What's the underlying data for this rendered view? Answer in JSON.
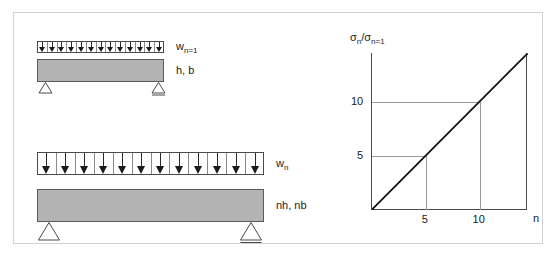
{
  "figure": {
    "background_color": "#ffffff",
    "frame_color": "#d2d2d2",
    "beam_fill_color": "#b3b3b3",
    "line_color": "#1a1a1a",
    "grid_color": "#9a9a9a"
  },
  "beams": [
    {
      "id": "beam-unit",
      "load_label": "w",
      "load_label_sub": "n=1",
      "section_label": "h, b",
      "arrow_count": 13,
      "arrow_size": "small",
      "support_left": "pin",
      "support_right": "roller"
    },
    {
      "id": "beam-scaled",
      "load_label": "w",
      "load_label_sub": "n",
      "section_label": "nh, nb",
      "arrow_count": 12,
      "arrow_size": "large",
      "support_left": "pin",
      "support_right": "roller"
    }
  ],
  "chart_data": {
    "type": "line",
    "title": "",
    "xlabel": "n",
    "ylabel_main": "σ",
    "ylabel_sub1": "n",
    "ylabel_mid": "/σ",
    "ylabel_sub2": "n=1",
    "ylabel_full": "σn/σn=1",
    "x": [
      0,
      5,
      10,
      14.5
    ],
    "y": [
      0,
      5,
      10,
      14.5
    ],
    "series": [
      {
        "name": "σn/σn=1 = n",
        "values": [
          0,
          5,
          10,
          14.5
        ]
      }
    ],
    "xtick_labels": [
      "5",
      "10"
    ],
    "xtick_values": [
      5,
      10
    ],
    "ytick_labels": [
      "5",
      "10"
    ],
    "ytick_values": [
      5,
      10
    ],
    "xlim": [
      0,
      14.5
    ],
    "ylim": [
      0,
      14.5
    ],
    "grid": true,
    "gridlines": [
      {
        "axis": "y",
        "value": 5,
        "label": "5"
      },
      {
        "axis": "y",
        "value": 10,
        "label": "10"
      },
      {
        "axis": "x",
        "value": 5,
        "label": "5"
      },
      {
        "axis": "x",
        "value": 10,
        "label": "10"
      }
    ],
    "legend": "none",
    "annotation": "Linear relation: stress ratio equals scale factor n"
  }
}
